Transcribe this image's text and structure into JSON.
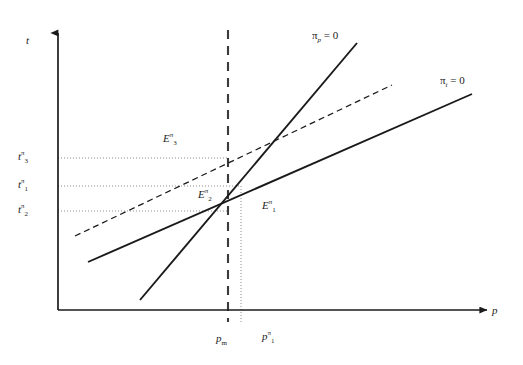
{
  "figure": {
    "type": "economics-phase-diagram",
    "background": "#ffffff",
    "stroke_color": "#1a1a1a",
    "grid_color": "#9a9a9a"
  },
  "axes": {
    "y_label": "t",
    "x_label": "p",
    "y_axis": {
      "x": 58,
      "y_top": 30,
      "y_bottom": 310
    },
    "x_axis": {
      "y": 310,
      "x_left": 58,
      "x_right": 490
    }
  },
  "curves": [
    {
      "id": "pi-p-zero",
      "label_pi": "π",
      "label_sub": "p",
      "label_eq": " = 0",
      "label_full": "πp = 0",
      "style": "solid",
      "slope": "steep-positive",
      "x1": 140,
      "y1": 300,
      "x2": 357,
      "y2": 43,
      "label_x": 312,
      "label_y": 30
    },
    {
      "id": "pi-t-zero",
      "label_pi": "π",
      "label_sub": "t",
      "label_eq": " = 0",
      "label_full": "πt = 0",
      "style": "solid",
      "slope": "shallow-positive",
      "x1": 88,
      "y1": 262,
      "x2": 472,
      "y2": 94,
      "label_x": 440,
      "label_y": 75
    },
    {
      "id": "pi-t-zero-shifted",
      "label_full": "",
      "style": "dashed",
      "slope": "shallow-positive",
      "x1": 75,
      "y1": 236,
      "x2": 392,
      "y2": 85,
      "label_x": null,
      "label_y": null
    }
  ],
  "vertical_lines": [
    {
      "id": "pm-line",
      "style": "dashed",
      "x": 228,
      "y_top": 30,
      "y_bottom": 322
    },
    {
      "id": "p1-line",
      "style": "dotted",
      "x": 241,
      "y_top": 186,
      "y_bottom": 322
    }
  ],
  "horizontal_guides": [
    {
      "id": "t3-guide",
      "style": "dotted",
      "y": 158,
      "x_start": 58,
      "x_end": 228
    },
    {
      "id": "t1-guide",
      "style": "dotted",
      "y": 186,
      "x_start": 58,
      "x_end": 241
    },
    {
      "id": "t2-guide",
      "style": "dotted",
      "y": 211,
      "x_start": 58,
      "x_end": 228
    }
  ],
  "y_ticks": [
    {
      "id": "t3",
      "base": "t",
      "sup": "π",
      "sub": "3",
      "x": 18,
      "y": 151
    },
    {
      "id": "t1",
      "base": "t",
      "sup": "π",
      "sub": "1",
      "x": 18,
      "y": 179
    },
    {
      "id": "t2",
      "base": "t",
      "sup": "π",
      "sub": "2",
      "x": 18,
      "y": 204
    }
  ],
  "x_ticks": [
    {
      "id": "pm",
      "base": "p",
      "sup": "",
      "sub": "m",
      "x": 216,
      "y": 333
    },
    {
      "id": "p1",
      "base": "p",
      "sup": "π",
      "sub": "1",
      "x": 262,
      "y": 331
    }
  ],
  "equilibria": [
    {
      "id": "E3",
      "base": "E",
      "sup": "π",
      "sub": "3",
      "x": 163,
      "y": 133
    },
    {
      "id": "E2",
      "base": "E",
      "sup": "π",
      "sub": "2",
      "x": 198,
      "y": 189
    },
    {
      "id": "E1",
      "base": "E",
      "sup": "π",
      "sub": "1",
      "x": 262,
      "y": 200
    }
  ]
}
